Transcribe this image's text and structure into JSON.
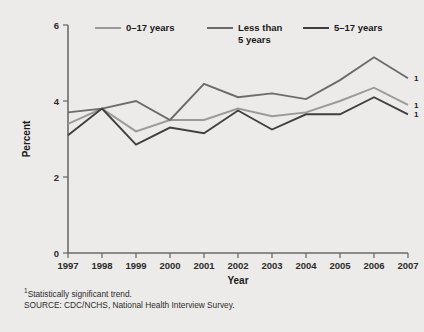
{
  "figure": {
    "background_color": "#edebe9",
    "plot_background_color": "#edebe9"
  },
  "legend": {
    "position": "top-inside",
    "entries": [
      {
        "label": "0–17 years",
        "color": "#9a9a99"
      },
      {
        "label": "Less than\n5 years",
        "color": "#6b6b6b"
      },
      {
        "label": "5–17 years",
        "color": "#3f3f3f"
      }
    ]
  },
  "axes": {
    "y_title": "Percent",
    "x_title": "Year",
    "y_ticks": [
      "0",
      "2",
      "4",
      "6"
    ],
    "y_tick_values": [
      0,
      2,
      4,
      6
    ],
    "x_ticks": [
      "1997",
      "1998",
      "1999",
      "2000",
      "2001",
      "2002",
      "2003",
      "2004",
      "2005",
      "2006",
      "2007"
    ]
  },
  "annotations": {
    "endnote_marker": "1",
    "endnote_marker_count": 3
  },
  "footnotes": [
    {
      "marker": "1",
      "text": "Statistically significant trend."
    },
    {
      "marker": "",
      "text": "SOURCE: CDC/NCHS, National Health Interview Survey."
    }
  ],
  "chart_data": {
    "type": "line",
    "title": "",
    "xlabel": "Year",
    "ylabel": "Percent",
    "x": [
      1997,
      1998,
      1999,
      2000,
      2001,
      2002,
      2003,
      2004,
      2005,
      2006,
      2007
    ],
    "categories": [
      "1997",
      "1998",
      "1999",
      "2000",
      "2001",
      "2002",
      "2003",
      "2004",
      "2005",
      "2006",
      "2007"
    ],
    "ylim": [
      0,
      6
    ],
    "xlim": [
      1997,
      2007
    ],
    "yticks": [
      0,
      2,
      4,
      6
    ],
    "grid": false,
    "legend_position": "top",
    "series": [
      {
        "name": "0–17 years",
        "color": "#9a9a99",
        "values": [
          3.4,
          3.8,
          3.2,
          3.5,
          3.5,
          3.8,
          3.6,
          3.7,
          4.0,
          4.35,
          3.9
        ],
        "significant_trend": true
      },
      {
        "name": "Less than 5 years",
        "color": "#6b6b6b",
        "values": [
          3.7,
          3.8,
          4.0,
          3.5,
          4.45,
          4.1,
          4.2,
          4.05,
          4.55,
          5.15,
          4.6
        ],
        "significant_trend": true
      },
      {
        "name": "5–17 years",
        "color": "#3f3f3f",
        "values": [
          3.1,
          3.8,
          2.85,
          3.3,
          3.15,
          3.75,
          3.25,
          3.65,
          3.65,
          4.1,
          3.65
        ],
        "significant_trend": true
      }
    ]
  }
}
